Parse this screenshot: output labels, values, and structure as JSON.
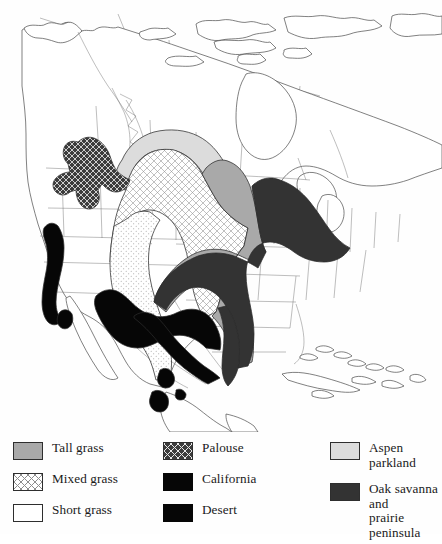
{
  "figure": {
    "type": "thematic-map"
  },
  "map": {
    "region": "North America",
    "projection_hint": "conic",
    "background_color": "#ffffff",
    "outline_color": "#4a4a4a",
    "subdivision_color": "#6e6e6e",
    "regions": [
      {
        "key": "tall_grass",
        "label": "Tall grass",
        "color": "#a9a9a9",
        "pattern": "solid",
        "location": "Central lowlands from Manitoba south through Iowa, Missouri and eastern Oklahoma to the Texas coast"
      },
      {
        "key": "mixed_grass",
        "label": "Mixed grass",
        "color": "#ffffff",
        "pattern": "cross-hatch",
        "location": "Northern and central Great Plains from Alberta and Saskatchewan south to Texas"
      },
      {
        "key": "short_grass",
        "label": "Short grass",
        "color": "#ffffff",
        "pattern": "stipple",
        "location": "Western High Plains along the Rocky Mountain front from Montana to west Texas"
      },
      {
        "key": "palouse",
        "label": "Palouse",
        "color": "#3c3c3c",
        "pattern": "dark-cross-hatch",
        "location": "Columbia Plateau of eastern Washington, northern Idaho and northeastern Oregon"
      },
      {
        "key": "california",
        "label": "California",
        "color": "#060606",
        "pattern": "solid",
        "location": "Central Valley and coastal valleys of California"
      },
      {
        "key": "desert",
        "label": "Desert",
        "color": "#060606",
        "pattern": "solid",
        "location": "Chihuahuan and Sonoran desert grasslands of northern Mexico, west Texas and Arizona"
      },
      {
        "key": "aspen",
        "label": "Aspen parkland",
        "color": "#dcdcdc",
        "pattern": "solid",
        "location": "Arc across central Alberta, Saskatchewan and Manitoba north of the mixed grass prairie"
      },
      {
        "key": "oak_savanna",
        "label": "Oak savanna and prairie peninsula",
        "color": "#333333",
        "pattern": "solid",
        "location": "Prairie peninsula of Illinois, Indiana, Wisconsin, Michigan and eastern Missouri"
      }
    ]
  },
  "legend": {
    "columns": [
      {
        "items": [
          {
            "label": "Tall grass",
            "swatch": "tall_grass"
          },
          {
            "label": "Mixed grass",
            "swatch": "mixed_grass"
          },
          {
            "label": "Short grass",
            "swatch": "short_grass"
          }
        ]
      },
      {
        "items": [
          {
            "label": "Palouse",
            "swatch": "palouse"
          },
          {
            "label": "California",
            "swatch": "california"
          },
          {
            "label": "Desert",
            "swatch": "desert"
          }
        ]
      },
      {
        "items": [
          {
            "label": "Aspen parkland",
            "swatch": "aspen"
          },
          {
            "label": "Oak savanna and\nprairie peninsula",
            "swatch": "oak_savanna"
          }
        ]
      }
    ]
  }
}
